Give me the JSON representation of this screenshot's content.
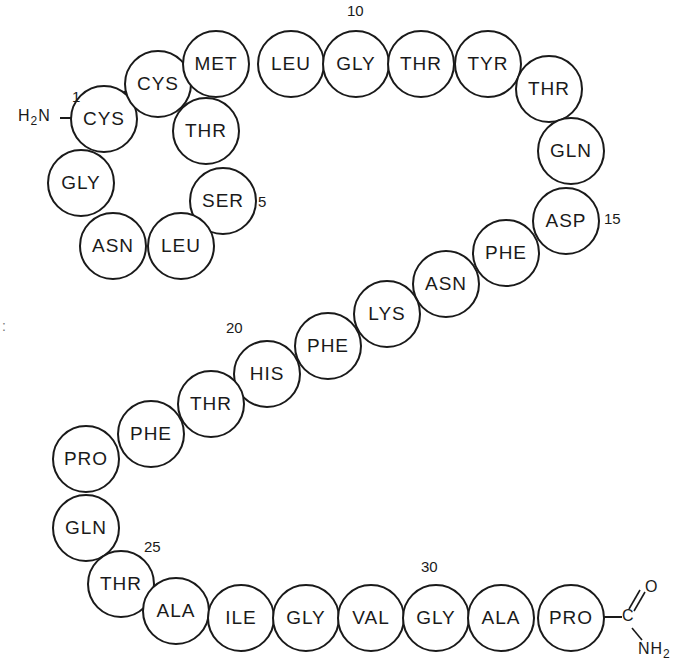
{
  "title": "",
  "n_terminus": {
    "label": "H2N",
    "main": "H",
    "sub": "2",
    "tail": "N"
  },
  "c_terminus": {
    "carbon": "C",
    "oxygen": "O",
    "amine_main": "NH",
    "amine_sub": "2"
  },
  "disulfide_bond": {
    "from": 1,
    "to": 2,
    "marker": "filled-square"
  },
  "residues": [
    {
      "pos": 1,
      "name": "CYS",
      "x": 103,
      "y": 118
    },
    {
      "pos": 2,
      "name": "CYS",
      "x": 157,
      "y": 83
    },
    {
      "pos": 3,
      "name": "THR",
      "x": 205,
      "y": 130
    },
    {
      "pos": 4,
      "name": "SER",
      "x": 222,
      "y": 200
    },
    {
      "pos": 5,
      "name": "LEU",
      "x": 180,
      "y": 245
    },
    {
      "pos": 6,
      "name": "ASN",
      "x": 112,
      "y": 245
    },
    {
      "pos": 7,
      "name": "GLY",
      "x": 80,
      "y": 182
    },
    {
      "pos": 8,
      "name": "MET",
      "x": 215,
      "y": 63
    },
    {
      "pos": 9,
      "name": "LEU",
      "x": 290,
      "y": 63
    },
    {
      "pos": 10,
      "name": "GLY",
      "x": 355,
      "y": 63
    },
    {
      "pos": 11,
      "name": "THR",
      "x": 420,
      "y": 63
    },
    {
      "pos": 12,
      "name": "TYR",
      "x": 487,
      "y": 63
    },
    {
      "pos": 13,
      "name": "THR",
      "x": 548,
      "y": 88
    },
    {
      "pos": 14,
      "name": "GLN",
      "x": 570,
      "y": 150
    },
    {
      "pos": 15,
      "name": "ASP",
      "x": 565,
      "y": 220
    },
    {
      "pos": 16,
      "name": "PHE",
      "x": 505,
      "y": 252
    },
    {
      "pos": 17,
      "name": "ASN",
      "x": 445,
      "y": 283
    },
    {
      "pos": 18,
      "name": "LYS",
      "x": 386,
      "y": 313
    },
    {
      "pos": 19,
      "name": "PHE",
      "x": 327,
      "y": 345
    },
    {
      "pos": 20,
      "name": "HIS",
      "x": 266,
      "y": 373
    },
    {
      "pos": 21,
      "name": "THR",
      "x": 210,
      "y": 403
    },
    {
      "pos": 22,
      "name": "PHE",
      "x": 150,
      "y": 433
    },
    {
      "pos": 23,
      "name": "PRO",
      "x": 85,
      "y": 458
    },
    {
      "pos": 24,
      "name": "GLN",
      "x": 85,
      "y": 527
    },
    {
      "pos": 25,
      "name": "THR",
      "x": 120,
      "y": 583
    },
    {
      "pos": 26,
      "name": "ALA",
      "x": 175,
      "y": 610
    },
    {
      "pos": 27,
      "name": "ILE",
      "x": 240,
      "y": 617
    },
    {
      "pos": 28,
      "name": "GLY",
      "x": 305,
      "y": 617
    },
    {
      "pos": 29,
      "name": "VAL",
      "x": 370,
      "y": 617
    },
    {
      "pos": 30,
      "name": "GLY",
      "x": 435,
      "y": 617
    },
    {
      "pos": 31,
      "name": "ALA",
      "x": 500,
      "y": 617
    },
    {
      "pos": 32,
      "name": "PRO",
      "x": 570,
      "y": 617
    }
  ],
  "position_labels": [
    {
      "text": "1",
      "x": 72,
      "y": 88
    },
    {
      "text": "5",
      "x": 258,
      "y": 193
    },
    {
      "text": "10",
      "x": 347,
      "y": 2
    },
    {
      "text": "15",
      "x": 604,
      "y": 210
    },
    {
      "text": "20",
      "x": 226,
      "y": 319
    },
    {
      "text": "25",
      "x": 144,
      "y": 538
    },
    {
      "text": "30",
      "x": 421,
      "y": 558
    }
  ],
  "edge_marks": {
    "text": ":"
  }
}
